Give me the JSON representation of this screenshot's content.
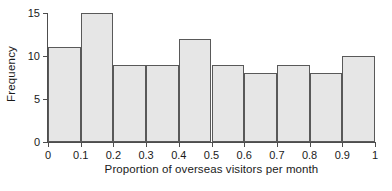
{
  "chart_data": {
    "type": "bar",
    "title": "",
    "subtitle": "",
    "xlabel": "Proportion of overseas visitors per month",
    "ylabel": "Frequency",
    "categories": [
      "0-0.1",
      "0.1-0.2",
      "0.2-0.3",
      "0.3-0.4",
      "0.4-0.5",
      "0.5-0.6",
      "0.6-0.7",
      "0.7-0.8",
      "0.8-0.9",
      "0.9-1"
    ],
    "bin_edges": [
      0,
      0.1,
      0.2,
      0.3,
      0.4,
      0.5,
      0.6,
      0.7,
      0.8,
      0.9,
      1
    ],
    "values": [
      11,
      15,
      9,
      9,
      12,
      9,
      8,
      9,
      8,
      10
    ],
    "xlim": [
      0,
      1
    ],
    "ylim": [
      0,
      15
    ],
    "xticks": [
      "0",
      "0.1",
      "0.2",
      "0.3",
      "0.4",
      "0.5",
      "0.6",
      "0.7",
      "0.8",
      "0.9",
      "1"
    ],
    "xtick_values": [
      0,
      0.1,
      0.2,
      0.3,
      0.4,
      0.5,
      0.6,
      0.7,
      0.8,
      0.9,
      1
    ],
    "yticks": [
      "0",
      "5",
      "10",
      "15"
    ],
    "ytick_values": [
      0,
      5,
      10,
      15
    ],
    "grid": false,
    "legend": null,
    "annotations": [],
    "colors": {
      "bar_fill": "#e6e6e6",
      "bar_edge": "#595959",
      "axis": "#4d4d4d",
      "text": "#1a1a1a",
      "background": "#ffffff"
    }
  }
}
